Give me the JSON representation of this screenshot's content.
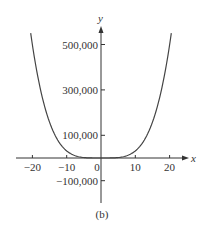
{
  "chart_data": {
    "type": "line",
    "title": "",
    "caption": "(b)",
    "xlabel": "x",
    "ylabel": "y",
    "xlim": [
      -24,
      24
    ],
    "ylim": [
      -190000,
      600000
    ],
    "grid": false,
    "x_ticks": [
      {
        "value": -20,
        "label": "−20"
      },
      {
        "value": -10,
        "label": "−10"
      },
      {
        "value": 0,
        "label": "0"
      },
      {
        "value": 10,
        "label": "10"
      },
      {
        "value": 20,
        "label": "20"
      }
    ],
    "y_ticks": [
      {
        "value": 500000,
        "label": "500,000"
      },
      {
        "value": 300000,
        "label": "300,000"
      },
      {
        "value": 100000,
        "label": "100,000"
      },
      {
        "value": -100000,
        "label": "−100,000"
      }
    ],
    "series": [
      {
        "name": "curve",
        "description": "even quartic-like curve, flat near 0 for |x| < ~5, rising steeply",
        "x": [
          -20.5,
          -18,
          -15,
          -12,
          -10,
          -8,
          -6,
          -4,
          0,
          4,
          6,
          8,
          10,
          12,
          15,
          18,
          20.5
        ],
        "y": [
          550000,
          330000,
          160000,
          65000,
          31000,
          12700,
          4000,
          800,
          0,
          800,
          4000,
          12700,
          31000,
          65000,
          160000,
          330000,
          550000
        ]
      }
    ]
  }
}
